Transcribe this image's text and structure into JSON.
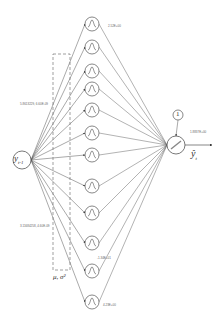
{
  "diagram": {
    "input_node": {
      "label": "y",
      "subscript": "t-1",
      "x": 22,
      "y": 160,
      "r": 9
    },
    "hidden_nodes": [
      {
        "y": 24
      },
      {
        "y": 47
      },
      {
        "y": 71
      },
      {
        "y": 89
      },
      {
        "y": 110
      },
      {
        "y": 133
      },
      {
        "y": 155
      },
      {
        "y": 186
      },
      {
        "y": 213
      },
      {
        "y": 243
      },
      {
        "y": 271
      },
      {
        "y": 302
      }
    ],
    "hidden_x": 92,
    "hidden_r": 7,
    "output_node": {
      "label": "ŷ",
      "subscript": "t",
      "x": 176,
      "y": 145,
      "r": 9
    },
    "bias_node": {
      "label": "1",
      "x": 178,
      "y": 115,
      "r": 5
    },
    "parameter_box": {
      "x": 53,
      "y": 54,
      "width": 17,
      "height": 216,
      "label": "μ, σ²"
    },
    "weight_labels": [
      {
        "text": "2.52E+00",
        "x": 108,
        "y": 24
      },
      {
        "text": "5.8613229, 6.60E-09",
        "x": 20,
        "y": 102
      },
      {
        "text": "3.11684258, 4.60E-09",
        "x": 20,
        "y": 224
      },
      {
        "text": "-1.34E+01",
        "x": 97,
        "y": 256
      },
      {
        "text": "4.23E+00",
        "x": 103,
        "y": 303
      },
      {
        "text": "1.8837E+00",
        "x": 190,
        "y": 130
      }
    ],
    "colors": {
      "stroke": "#555555",
      "dashed": "#777777",
      "background": "#ffffff"
    }
  }
}
